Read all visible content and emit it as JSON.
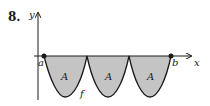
{
  "figure": {
    "problem_number": "8.",
    "axis_labels": {
      "x": "x",
      "y": "y"
    },
    "point_labels": {
      "a": "a",
      "b": "b"
    },
    "region_labels": [
      "A",
      "A",
      "A"
    ],
    "function_label": "f",
    "colors": {
      "shade": "#c4c4c4",
      "stroke": "#1a1a1a"
    }
  }
}
